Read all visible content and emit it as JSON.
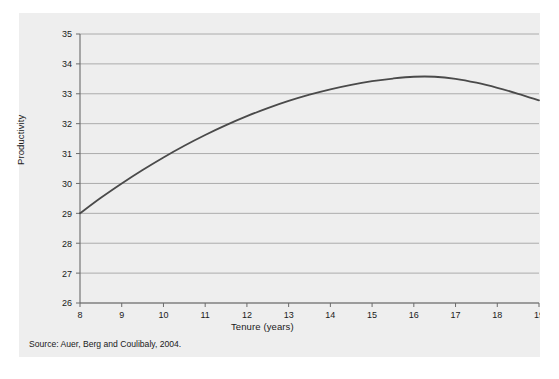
{
  "figure": {
    "background_color": "#eeeeee",
    "source_note": "Source: Auer, Berg and Coulibaly, 2004."
  },
  "chart_data": {
    "type": "line",
    "title": "",
    "xlabel": "Tenure (years)",
    "ylabel": "Productivity",
    "xlim": [
      8,
      19
    ],
    "ylim": [
      26,
      35
    ],
    "grid": true,
    "grid_axis": "y",
    "legend": false,
    "line_color": "#4a4a4a",
    "x_ticks": [
      8,
      9,
      10,
      11,
      12,
      13,
      14,
      15,
      16,
      17,
      18,
      19
    ],
    "x_tick_labels": [
      "8",
      "9",
      "10",
      "11",
      "12",
      "13",
      "14",
      "15",
      "16",
      "17",
      "18",
      "19"
    ],
    "y_ticks": [
      26,
      27,
      28,
      29,
      30,
      31,
      32,
      33,
      34,
      35
    ],
    "y_tick_labels": [
      "26",
      "27",
      "28",
      "29",
      "30",
      "31",
      "32",
      "33",
      "34",
      "35"
    ],
    "series": [
      {
        "name": "Productivity",
        "x": [
          8,
          8.5,
          9,
          9.5,
          10,
          10.5,
          11,
          11.5,
          12,
          12.5,
          13,
          13.5,
          14,
          14.5,
          15,
          15.5,
          16,
          16.5,
          17,
          17.5,
          18,
          18.5,
          19
        ],
        "values": [
          29.0,
          29.52,
          30.0,
          30.45,
          30.87,
          31.26,
          31.62,
          31.95,
          32.25,
          32.52,
          32.76,
          32.97,
          33.15,
          33.3,
          33.42,
          33.51,
          33.57,
          33.57,
          33.5,
          33.37,
          33.2,
          33.0,
          32.78
        ]
      }
    ]
  }
}
